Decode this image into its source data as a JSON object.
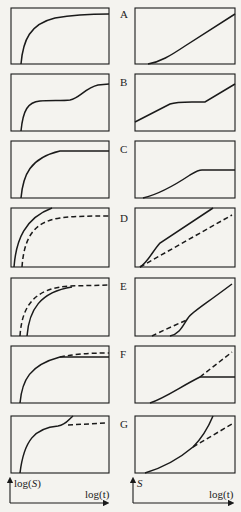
{
  "figure": {
    "rows": [
      {
        "label": "A"
      },
      {
        "label": "B"
      },
      {
        "label": "C"
      },
      {
        "label": "D"
      },
      {
        "label": "E"
      },
      {
        "label": "F"
      },
      {
        "label": "G"
      }
    ],
    "left_axes": {
      "y_label_prefix": "log(",
      "y_label_var": "S",
      "y_label_suffix": ")",
      "x_label": "log(t)"
    },
    "right_axes": {
      "y_label": "S",
      "x_label": "log(t)"
    }
  },
  "colors": {
    "line": "#1a1a1a",
    "background": "#f4f3ef"
  }
}
